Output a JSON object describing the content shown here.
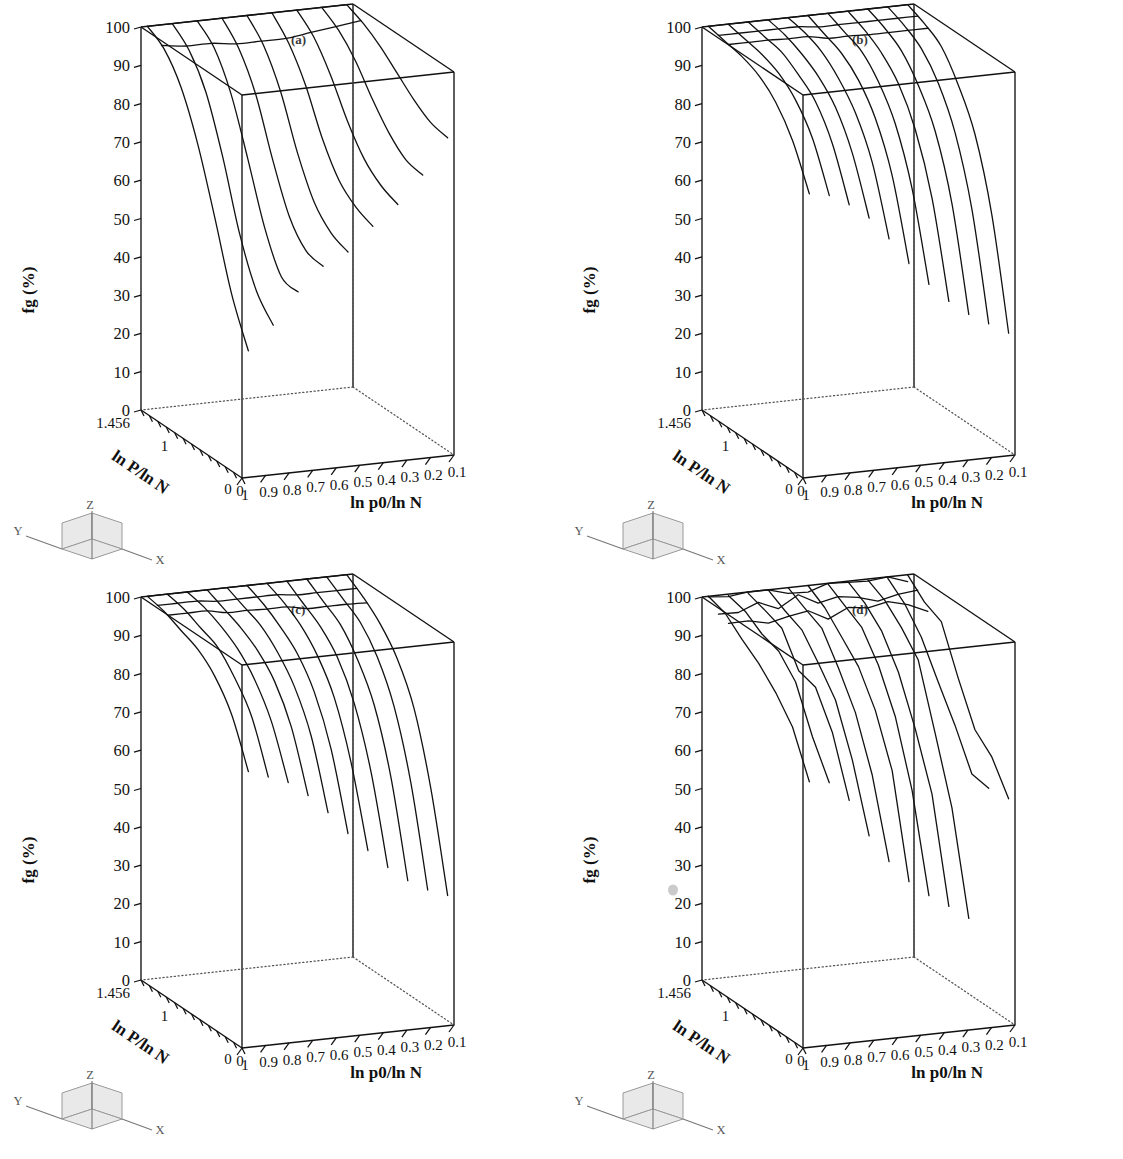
{
  "figure": {
    "background": "#ffffff",
    "line_color": "#111111",
    "panels": [
      {
        "label": "(a)",
        "x": 0,
        "y": 0
      },
      {
        "label": "(b)",
        "x": 561,
        "y": 0
      },
      {
        "label": "(c)",
        "x": 0,
        "y": 570
      },
      {
        "label": "(d)",
        "x": 561,
        "y": 570
      }
    ]
  },
  "axes": {
    "z_title": "fg (%)",
    "x_title": "ln p0/ln N",
    "y_title": "ln P/ln N",
    "z_ticks": [
      "100",
      "90",
      "80",
      "70",
      "60",
      "50",
      "40",
      "30",
      "20",
      "10",
      "0"
    ],
    "x_ticks": [
      "1",
      "0.9",
      "0.8",
      "0.7",
      "0.6",
      "0.5",
      "0.4",
      "0.3",
      "0.2",
      "0.1"
    ],
    "y_ticks": [
      "1.456",
      "1",
      "0"
    ],
    "z_origin_label": "0",
    "x_origin_label": "0"
  },
  "orientation_key": {
    "x_label": "X",
    "y_label": "Y",
    "z_label": "Z"
  },
  "chart_data": {
    "type": "line",
    "title": "",
    "subplots": [
      {
        "panel": "(a)",
        "xlabel": "ln p0/ln N",
        "ylabel": "ln P/ln N",
        "zlabel": "fg (%)",
        "zlim": [
          0,
          100
        ],
        "xlim": [
          1.0,
          0.1
        ],
        "ylim": [
          0,
          1.456
        ],
        "grid": false,
        "legend": "none",
        "description": "3D mesh surface of fg versus ln p0/ln N and ln P/ln N; fg falls steeply toward low ln p0/ln N and low ln P/ln N, reaching ~0-30% near the front-left corner.",
        "ridge_curves_count": 9,
        "surface_z_at_back_edge": 100,
        "surface_z_min_visible": 0,
        "series": [
          {
            "name": "p0=1.0",
            "x_const": 1.0,
            "values": [
              100,
              97,
              90,
              78,
              62,
              45,
              33
            ]
          },
          {
            "name": "p0=0.9",
            "x_const": 0.9,
            "values": [
              100,
              96,
              88,
              74,
              57,
              45,
              39
            ]
          },
          {
            "name": "p0=0.8",
            "x_const": 0.8,
            "values": [
              100,
              96,
              87,
              73,
              58,
              48,
              47
            ]
          },
          {
            "name": "p0=0.7",
            "x_const": 0.7,
            "values": [
              100,
              95,
              86,
              72,
              60,
              54,
              53
            ]
          },
          {
            "name": "p0=0.6",
            "x_const": 0.6,
            "values": [
              100,
              95,
              86,
              73,
              63,
              58,
              56
            ]
          },
          {
            "name": "p0=0.5",
            "x_const": 0.5,
            "values": [
              100,
              95,
              87,
              76,
              68,
              64,
              62
            ]
          },
          {
            "name": "p0=0.4",
            "x_const": 0.4,
            "values": [
              100,
              96,
              89,
              80,
              73,
              69,
              67
            ]
          },
          {
            "name": "p0=0.3",
            "x_const": 0.3,
            "values": [
              100,
              97,
              92,
              85,
              79,
              75,
              74
            ]
          },
          {
            "name": "p0=0.2",
            "x_const": 0.2,
            "values": [
              100,
              98,
              95,
              91,
              87,
              84,
              83
            ]
          }
        ]
      },
      {
        "panel": "(b)",
        "xlabel": "ln p0/ln N",
        "ylabel": "ln P/ln N",
        "zlabel": "fg (%)",
        "zlim": [
          0,
          100
        ],
        "xlim": [
          1.0,
          0.1
        ],
        "ylim": [
          0,
          1.456
        ],
        "grid": false,
        "legend": "none",
        "description": "3D mesh surface with a broad high plateau near fg=100% and a sharp drop only at the lowest ln P/ln N values; visible curves terminate between 30% and 75%.",
        "ridge_curves_count": 11,
        "surface_z_at_back_edge": 100,
        "surface_z_min_visible": 30,
        "series": [
          {
            "name": "p0=1.0",
            "x_const": 1.0,
            "values": [
              100,
              99,
              98,
              96,
              92,
              85,
              74
            ]
          },
          {
            "name": "p0=0.9",
            "x_const": 0.9,
            "values": [
              100,
              99,
              98,
              96,
              92,
              85,
              73
            ]
          },
          {
            "name": "p0=0.8",
            "x_const": 0.8,
            "values": [
              100,
              99,
              98,
              95,
              91,
              83,
              70
            ]
          },
          {
            "name": "p0=0.7",
            "x_const": 0.7,
            "values": [
              100,
              99,
              97,
              94,
              89,
              80,
              66
            ]
          },
          {
            "name": "p0=0.6",
            "x_const": 0.6,
            "values": [
              100,
              99,
              97,
              93,
              87,
              77,
              60
            ]
          },
          {
            "name": "p0=0.5",
            "x_const": 0.5,
            "values": [
              100,
              98,
              96,
              92,
              85,
              73,
              53
            ]
          },
          {
            "name": "p0=0.4",
            "x_const": 0.4,
            "values": [
              100,
              98,
              96,
              91,
              83,
              69,
              47
            ]
          },
          {
            "name": "p0=0.3",
            "x_const": 0.3,
            "values": [
              100,
              98,
              95,
              90,
              81,
              66,
              42
            ]
          },
          {
            "name": "p0=0.2",
            "x_const": 0.2,
            "values": [
              100,
              98,
              95,
              89,
              80,
              64,
              38
            ]
          },
          {
            "name": "p0=0.15",
            "x_const": 0.15,
            "values": [
              100,
              98,
              95,
              89,
              79,
              62,
              35
            ]
          },
          {
            "name": "p0=0.1",
            "x_const": 0.1,
            "values": [
              100,
              98,
              95,
              88,
              78,
              60,
              32
            ]
          }
        ]
      },
      {
        "panel": "(c)",
        "xlabel": "ln p0/ln N",
        "ylabel": "ln P/ln N",
        "zlabel": "fg (%)",
        "zlim": [
          0,
          100
        ],
        "xlim": [
          1.0,
          0.1
        ],
        "ylim": [
          0,
          1.456
        ],
        "grid": false,
        "legend": "none",
        "description": "3D mesh surface very similar to (b) but with a slightly softer plateau; mesh ridge lines fan across the top face and fall to ~35-75% at the front.",
        "ridge_curves_count": 12,
        "surface_z_at_back_edge": 100,
        "surface_z_min_visible": 33,
        "series": [
          {
            "name": "p0=1.0",
            "x_const": 1.0,
            "values": [
              100,
              99,
              97,
              95,
              91,
              84,
              72
            ]
          },
          {
            "name": "p0=0.9",
            "x_const": 0.9,
            "values": [
              100,
              99,
              97,
              95,
              90,
              83,
              70
            ]
          },
          {
            "name": "p0=0.8",
            "x_const": 0.8,
            "values": [
              100,
              99,
              97,
              94,
              89,
              81,
              68
            ]
          },
          {
            "name": "p0=0.7",
            "x_const": 0.7,
            "values": [
              100,
              98,
              96,
              93,
              88,
              79,
              64
            ]
          },
          {
            "name": "p0=0.6",
            "x_const": 0.6,
            "values": [
              100,
              98,
              96,
              92,
              86,
              76,
              59
            ]
          },
          {
            "name": "p0=0.5",
            "x_const": 0.5,
            "values": [
              100,
              98,
              95,
              91,
              84,
              72,
              53
            ]
          },
          {
            "name": "p0=0.4",
            "x_const": 0.4,
            "values": [
              100,
              98,
              95,
              90,
              82,
              68,
              48
            ]
          },
          {
            "name": "p0=0.3",
            "x_const": 0.3,
            "values": [
              100,
              97,
              94,
              89,
              80,
              65,
              43
            ]
          },
          {
            "name": "p0=0.2",
            "x_const": 0.2,
            "values": [
              100,
              97,
              94,
              88,
              79,
              63,
              39
            ]
          },
          {
            "name": "p0=0.15",
            "x_const": 0.15,
            "values": [
              100,
              97,
              94,
              88,
              78,
              61,
              36
            ]
          },
          {
            "name": "p0=0.1",
            "x_const": 0.1,
            "values": [
              100,
              97,
              93,
              87,
              77,
              59,
              34
            ]
          }
        ]
      },
      {
        "panel": "(d)",
        "xlabel": "ln p0/ln N",
        "ylabel": "ln P/ln N",
        "zlabel": "fg (%)",
        "zlim": [
          0,
          100
        ],
        "xlim": [
          1.0,
          0.1
        ],
        "ylim": [
          0,
          1.456
        ],
        "grid": false,
        "legend": "none",
        "description": "3D mesh surface like (b)/(c) but noticeably noisier: stepped, jagged ridge lines with abrupt kinks in the mid region; curves terminate between 28% and 75%.",
        "ridge_curves_count": 11,
        "surface_z_at_back_edge": 100,
        "surface_z_min_visible": 28,
        "noisy": true,
        "series": [
          {
            "name": "p0=1.0",
            "x_const": 1.0,
            "values": [
              100,
              98,
              95,
              91,
              86,
              80,
              72
            ]
          },
          {
            "name": "p0=0.9",
            "x_const": 0.9,
            "values": [
              100,
              98,
              95,
              92,
              87,
              79,
              67
            ]
          },
          {
            "name": "p0=0.8",
            "x_const": 0.8,
            "values": [
              100,
              98,
              95,
              91,
              85,
              76,
              62
            ]
          },
          {
            "name": "p0=0.7",
            "x_const": 0.7,
            "values": [
              100,
              98,
              95,
              90,
              83,
              72,
              55
            ]
          },
          {
            "name": "p0=0.6",
            "x_const": 0.6,
            "values": [
              100,
              98,
              94,
              89,
              81,
              68,
              48
            ]
          },
          {
            "name": "p0=0.5",
            "x_const": 0.5,
            "values": [
              100,
              97,
              94,
              88,
              79,
              64,
              42
            ]
          },
          {
            "name": "p0=0.4",
            "x_const": 0.4,
            "values": [
              100,
              97,
              93,
              87,
              77,
              61,
              37
            ]
          },
          {
            "name": "p0=0.3",
            "x_const": 0.3,
            "values": [
              100,
              97,
              93,
              86,
              76,
              58,
              33
            ]
          },
          {
            "name": "p0=0.2",
            "x_const": 0.2,
            "values": [
              100,
              97,
              92,
              85,
              74,
              56,
              30
            ]
          },
          {
            "name": "p0=0.15",
            "x_const": 0.15,
            "values": [
              100,
              96,
              92,
              84,
              73,
              62,
              60
            ]
          },
          {
            "name": "p0=0.1",
            "x_const": 0.1,
            "values": [
              100,
              96,
              91,
              84,
              74,
              68,
              61
            ]
          }
        ]
      }
    ]
  }
}
